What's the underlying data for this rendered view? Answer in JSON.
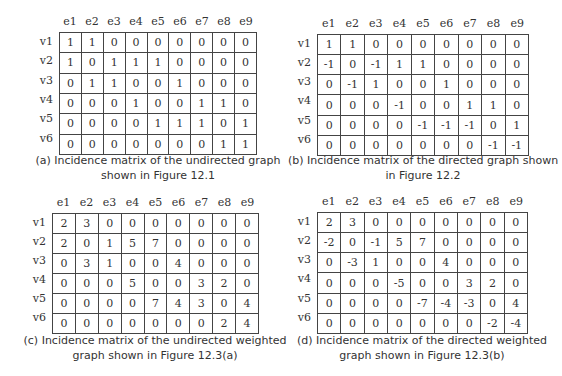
{
  "panels": [
    {
      "id": "a",
      "columns": [
        "e1",
        "e2",
        "e3",
        "e4",
        "e5",
        "e6",
        "e7",
        "e8",
        "e9"
      ],
      "rows": [
        "v1",
        "v2",
        "v3",
        "v4",
        "v5",
        "v6"
      ],
      "matrix": [
        [
          "1",
          "1",
          "0",
          "0",
          "0",
          "0",
          "0",
          "0",
          "0"
        ],
        [
          "1",
          "0",
          "1",
          "1",
          "1",
          "0",
          "0",
          "0",
          "0"
        ],
        [
          "0",
          "1",
          "1",
          "0",
          "0",
          "1",
          "0",
          "0",
          "0"
        ],
        [
          "0",
          "0",
          "0",
          "1",
          "0",
          "0",
          "1",
          "1",
          "0"
        ],
        [
          "0",
          "0",
          "0",
          "0",
          "1",
          "1",
          "1",
          "0",
          "1"
        ],
        [
          "0",
          "0",
          "0",
          "0",
          "0",
          "0",
          "0",
          "1",
          "1"
        ]
      ],
      "caption_line1": "(a) Incidence matrix of the undirected graph",
      "caption_line2": "shown in Figure 12.1"
    },
    {
      "id": "b",
      "columns": [
        "e1",
        "e2",
        "e3",
        "e4",
        "e5",
        "e6",
        "e7",
        "e8",
        "e9"
      ],
      "rows": [
        "v1",
        "v2",
        "v3",
        "v4",
        "v5",
        "v6"
      ],
      "matrix": [
        [
          "1",
          "1",
          "0",
          "0",
          "0",
          "0",
          "0",
          "0",
          "0"
        ],
        [
          "-1",
          "0",
          "-1",
          "1",
          "1",
          "0",
          "0",
          "0",
          "0"
        ],
        [
          "0",
          "-1",
          "1",
          "0",
          "0",
          "1",
          "0",
          "0",
          "0"
        ],
        [
          "0",
          "0",
          "0",
          "-1",
          "0",
          "0",
          "1",
          "1",
          "0"
        ],
        [
          "0",
          "0",
          "0",
          "0",
          "-1",
          "-1",
          "-1",
          "0",
          "1"
        ],
        [
          "0",
          "0",
          "0",
          "0",
          "0",
          "0",
          "0",
          "-1",
          "-1"
        ]
      ],
      "caption_line1": "(b) Incidence matrix of the directed graph shown",
      "caption_line2": "in Figure 12.2"
    },
    {
      "id": "c",
      "columns": [
        "e1",
        "e2",
        "e3",
        "e4",
        "e5",
        "e6",
        "e7",
        "e8",
        "e9"
      ],
      "rows": [
        "v1",
        "v2",
        "v3",
        "v4",
        "v5",
        "v6"
      ],
      "matrix": [
        [
          "2",
          "3",
          "0",
          "0",
          "0",
          "0",
          "0",
          "0",
          "0"
        ],
        [
          "2",
          "0",
          "1",
          "5",
          "7",
          "0",
          "0",
          "0",
          "0"
        ],
        [
          "0",
          "3",
          "1",
          "0",
          "0",
          "4",
          "0",
          "0",
          "0"
        ],
        [
          "0",
          "0",
          "0",
          "5",
          "0",
          "0",
          "3",
          "2",
          "0"
        ],
        [
          "0",
          "0",
          "0",
          "0",
          "7",
          "4",
          "3",
          "0",
          "4"
        ],
        [
          "0",
          "0",
          "0",
          "0",
          "0",
          "0",
          "0",
          "2",
          "4"
        ]
      ],
      "caption_line1": "(c) Incidence matrix of the undirected weighted",
      "caption_line2": "graph shown in Figure 12.3(a)"
    },
    {
      "id": "d",
      "columns": [
        "e1",
        "e2",
        "e3",
        "e4",
        "e5",
        "e6",
        "e7",
        "e8",
        "e9"
      ],
      "rows": [
        "v1",
        "v2",
        "v3",
        "v4",
        "v5",
        "v6"
      ],
      "matrix": [
        [
          "2",
          "3",
          "0",
          "0",
          "0",
          "0",
          "0",
          "0",
          "0"
        ],
        [
          "-2",
          "0",
          "-1",
          "5",
          "7",
          "0",
          "0",
          "0",
          "0"
        ],
        [
          "0",
          "-3",
          "1",
          "0",
          "0",
          "4",
          "0",
          "0",
          "0"
        ],
        [
          "0",
          "0",
          "0",
          "-5",
          "0",
          "0",
          "3",
          "2",
          "0"
        ],
        [
          "0",
          "0",
          "0",
          "0",
          "-7",
          "-4",
          "-3",
          "0",
          "4"
        ],
        [
          "0",
          "0",
          "0",
          "0",
          "0",
          "0",
          "0",
          "-2",
          "-4"
        ]
      ],
      "caption_line1": "(d) Incidence matrix of the directed weighted",
      "caption_line2": "graph shown in Figure 12.3(b)"
    }
  ]
}
